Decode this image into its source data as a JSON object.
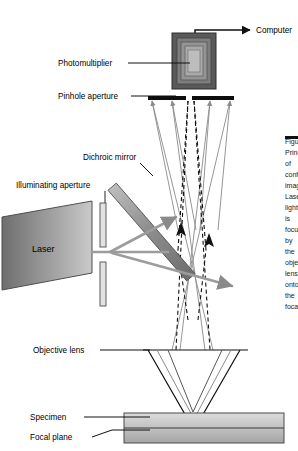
{
  "figure": {
    "labels": {
      "computer": "Computer",
      "photomultiplier": "Photomultiplier",
      "pinhole_aperture": "Pinhole aperture",
      "dichroic_mirror": "Dichroic mirror",
      "illuminating_aperture": "Illuminating aperture",
      "laser": "Laser",
      "objective_lens": "Objective lens",
      "specimen": "Specimen",
      "focal_plane": "Focal plane"
    },
    "caption_lines": [
      "Figure",
      "Principle",
      "of",
      "confocal",
      "imaging.",
      "Laser",
      "light",
      "is",
      "focused",
      "by",
      "the",
      "objective",
      "lens",
      "onto",
      "the",
      "focal",
      "plane",
      "in",
      "the",
      "specimen.",
      "Emitted",
      "light",
      "returns",
      "through",
      "the",
      "dichroic",
      "mirror",
      "to",
      "the",
      "pinhole",
      "aperture",
      "and",
      "is",
      "detected",
      "by",
      "the",
      "photomultiplier.",
      "Out-of-focus",
      "light",
      "is",
      "rejected",
      "at",
      "the",
      "pinhole."
    ]
  },
  "colors": {
    "laser_fill_dark": "#6e6e6e",
    "laser_fill_light": "#c9c9c9",
    "mirror_fill": "#9a9a9a",
    "pmt_outer": "#5a5a5a",
    "pmt_mid": "#8c8c8c",
    "pmt_inner": "#b5b5b5",
    "specimen_top": "#d6d6d6",
    "specimen_bottom": "#a8a8a8",
    "ray_solid": "#8a8a8a",
    "ray_dashed": "#111111",
    "bar_black": "#0d0d0d",
    "leader_line": "#111111"
  }
}
